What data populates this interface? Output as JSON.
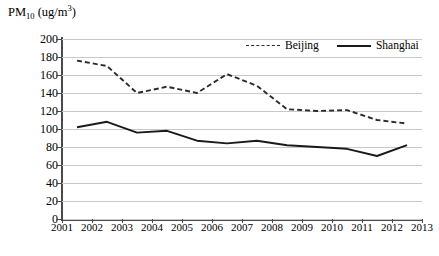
{
  "chart_data": {
    "type": "line",
    "title": "",
    "ylabel": "PM10 (ug/m3)",
    "ylabel_parts": {
      "prefix": "PM",
      "subscript": "10",
      "unit_open": " (ug/m",
      "superscript": "3",
      "unit_close": ")"
    },
    "xlabel": "",
    "categories": [
      "2001",
      "2002",
      "2003",
      "2004",
      "2005",
      "2006",
      "2007",
      "2008",
      "2009",
      "2010",
      "2011",
      "2012"
    ],
    "x_tick_labels": [
      "2001",
      "2002",
      "2003",
      "2004",
      "2005",
      "2006",
      "2007",
      "2008",
      "2009",
      "2010",
      "2011",
      "2012",
      "2013"
    ],
    "y_tick_labels": [
      "0",
      "20",
      "40",
      "60",
      "80",
      "100",
      "120",
      "140",
      "160",
      "180",
      "200"
    ],
    "ylim": [
      0,
      200
    ],
    "y_tick_step": 20,
    "grid": true,
    "grid_axis": "y",
    "legend_position": "top-right",
    "series": [
      {
        "name": "Beijing",
        "style": "dashed",
        "color": "#2b2b2b",
        "values": [
          176,
          170,
          140,
          147,
          140,
          161,
          148,
          122,
          120,
          121,
          110,
          106
        ]
      },
      {
        "name": "Shanghai",
        "style": "solid",
        "color": "#1a1a1a",
        "values": [
          102,
          108,
          96,
          98,
          87,
          84,
          87,
          82,
          80,
          78,
          70,
          82
        ]
      }
    ]
  },
  "legend": {
    "entries": [
      {
        "label": "Beijing",
        "style": "dashed"
      },
      {
        "label": "Shanghai",
        "style": "solid"
      }
    ]
  },
  "colors": {
    "background": "#ffffff",
    "axis": "#4a4a4a",
    "gridline": "#c9c9c9",
    "beijing": "#2b2b2b",
    "shanghai": "#1a1a1a"
  }
}
